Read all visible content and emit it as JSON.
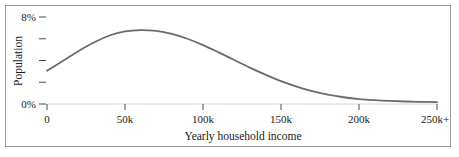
{
  "chart_data": {
    "type": "line",
    "title": "",
    "xlabel": "Yearly household income",
    "ylabel": "Population",
    "xtick_labels": [
      "0",
      "50k",
      "100k",
      "150k",
      "200k",
      "250k+"
    ],
    "xtick_values": [
      0,
      50000,
      100000,
      150000,
      200000,
      250000
    ],
    "ytick_labels": [
      "0%",
      "",
      "",
      "",
      "8%"
    ],
    "ytick_values": [
      0,
      2,
      4,
      6,
      8
    ],
    "ylim": [
      0,
      8
    ],
    "xlim": [
      0,
      250000
    ],
    "grid": false,
    "legend": false,
    "series": [
      {
        "name": "Population share",
        "x": [
          0,
          10000,
          20000,
          30000,
          40000,
          50000,
          60000,
          70000,
          80000,
          90000,
          100000,
          110000,
          120000,
          130000,
          140000,
          150000,
          160000,
          170000,
          180000,
          190000,
          200000,
          210000,
          220000,
          230000,
          240000,
          250000
        ],
        "values": [
          3.05,
          3.95,
          4.85,
          5.65,
          6.3,
          6.68,
          6.8,
          6.72,
          6.45,
          6.0,
          5.42,
          4.75,
          4.05,
          3.35,
          2.7,
          2.1,
          1.6,
          1.18,
          0.86,
          0.62,
          0.45,
          0.35,
          0.28,
          0.23,
          0.2,
          0.18
        ]
      }
    ],
    "line_color": "#6b6b6b",
    "line_width": 1.8,
    "axis_color": "#9a9a9a",
    "text_color": "#1a1a1a"
  },
  "axes": {
    "x_title": "Yearly household income",
    "y_title": "Population",
    "y_top_label": "8%",
    "y_bottom_label": "0%",
    "x_labels": [
      "0",
      "50k",
      "100k",
      "150k",
      "200k",
      "250k+"
    ]
  }
}
